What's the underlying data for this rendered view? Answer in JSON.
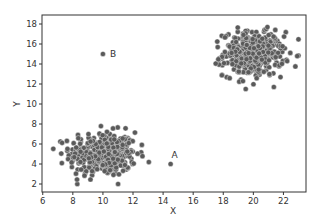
{
  "chart_data": {
    "type": "scatter",
    "title": "",
    "xlabel": "X",
    "ylabel": "Y",
    "xlim": [
      5.95,
      23.5
    ],
    "ylim": [
      1.2,
      18.9
    ],
    "grid": false,
    "legend": null,
    "xticks": [
      6,
      8,
      10,
      12,
      14,
      16,
      18,
      20,
      22
    ],
    "yticks": [
      2,
      4,
      6,
      8,
      10,
      12,
      14,
      16,
      18
    ],
    "marker_color": "#5a5a5a",
    "marker_edge": "#ffffff",
    "clusters": [
      {
        "name": "cluster-1",
        "center": [
          10,
          5
        ],
        "std": [
          1.1,
          1.1
        ],
        "n": 400,
        "x_range": [
          6.7,
          13.2
        ],
        "y_range": [
          2.0,
          7.9
        ]
      },
      {
        "name": "cluster-2",
        "center": [
          20,
          15
        ],
        "std": [
          1.0,
          1.1
        ],
        "n": 400,
        "x_range": [
          17.5,
          23.0
        ],
        "y_range": [
          11.5,
          18.0
        ]
      }
    ],
    "annotations": [
      {
        "label": "A",
        "x": 14.5,
        "y": 4.0
      },
      {
        "label": "B",
        "x": 10.0,
        "y": 15.0
      }
    ]
  }
}
